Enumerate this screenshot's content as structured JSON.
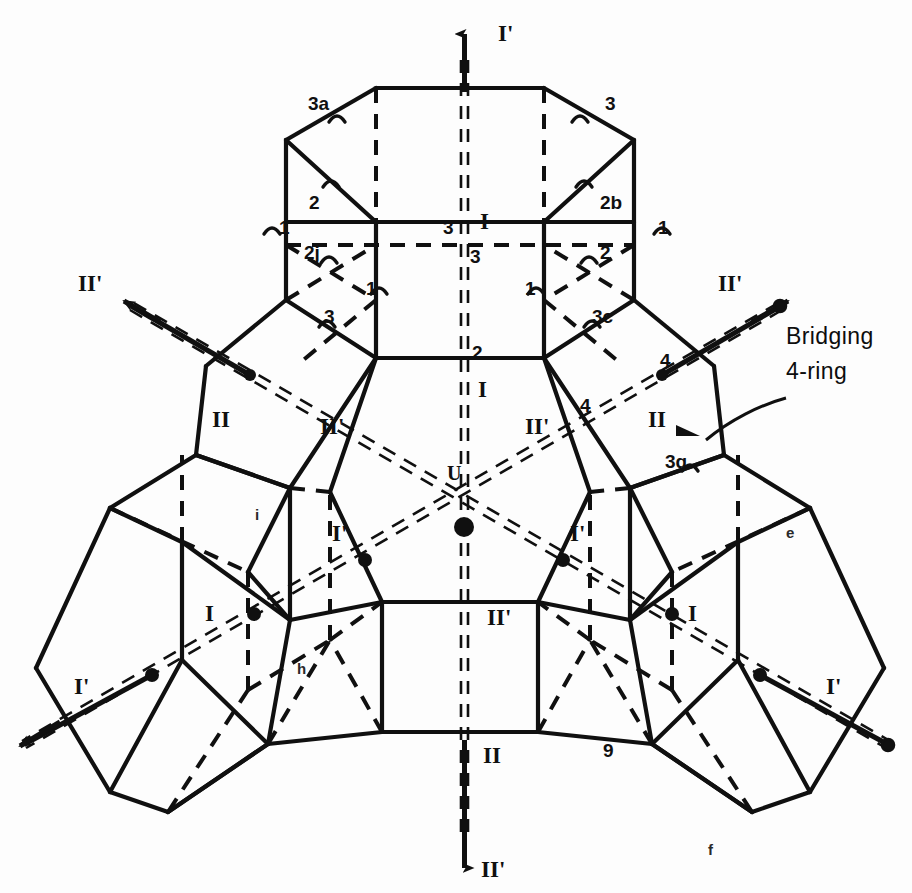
{
  "figure": {
    "type": "crystal-framework-schematic",
    "background_color": "#fdfdfd",
    "line_color": "#101010"
  },
  "annotations": {
    "bridging": {
      "line1": "Bridging",
      "line2": "4-ring"
    },
    "center_site": "U"
  },
  "axis_labels": [
    {
      "id": "axis-top-I-prime",
      "text": "I'",
      "x": 498,
      "y": 22
    },
    {
      "id": "axis-left-II-prime",
      "text": "II'",
      "x": 78,
      "y": 272
    },
    {
      "id": "axis-right-II-prime",
      "text": "II'",
      "x": 718,
      "y": 272
    },
    {
      "id": "axis-inner-left-II",
      "text": "II",
      "x": 212,
      "y": 408
    },
    {
      "id": "axis-inner-left-II-prime",
      "text": "II'",
      "x": 320,
      "y": 415
    },
    {
      "id": "axis-inner-right-II-prime",
      "text": "II'",
      "x": 525,
      "y": 415
    },
    {
      "id": "axis-inner-right-II",
      "text": "II",
      "x": 648,
      "y": 408
    },
    {
      "id": "axis-mid-left-I-prime",
      "text": "I'",
      "x": 332,
      "y": 522
    },
    {
      "id": "axis-mid-right-I-prime",
      "text": "I'",
      "x": 570,
      "y": 522
    },
    {
      "id": "axis-lower-left-I",
      "text": "I",
      "x": 205,
      "y": 602
    },
    {
      "id": "axis-lower-right-I",
      "text": "I",
      "x": 688,
      "y": 602
    },
    {
      "id": "axis-far-left-I-prime",
      "text": "I'",
      "x": 74,
      "y": 675
    },
    {
      "id": "axis-far-right-I-prime",
      "text": "I'",
      "x": 826,
      "y": 675
    },
    {
      "id": "axis-center-top-I",
      "text": "I",
      "x": 480,
      "y": 210
    },
    {
      "id": "axis-center-mid-I",
      "text": "I",
      "x": 478,
      "y": 378
    },
    {
      "id": "axis-center-II-prime-up",
      "text": "II'",
      "x": 487,
      "y": 606
    },
    {
      "id": "axis-center-II",
      "text": "II",
      "x": 483,
      "y": 744
    },
    {
      "id": "axis-bottom-II-prime",
      "text": "II'",
      "x": 481,
      "y": 858
    }
  ],
  "site_labels": [
    {
      "id": "site-3a",
      "text": "3a",
      "x": 308,
      "y": 94
    },
    {
      "id": "site-3-tr",
      "text": "3",
      "x": 605,
      "y": 94
    },
    {
      "id": "site-2-l",
      "text": "2",
      "x": 309,
      "y": 193
    },
    {
      "id": "site-2b",
      "text": "2b",
      "x": 600,
      "y": 193
    },
    {
      "id": "site-1-fl",
      "text": "1",
      "x": 279,
      "y": 218
    },
    {
      "id": "site-1-fr",
      "text": "1",
      "x": 658,
      "y": 218
    },
    {
      "id": "site-3-ctl",
      "text": "3",
      "x": 443,
      "y": 218
    },
    {
      "id": "site-3-ct",
      "text": "3",
      "x": 470,
      "y": 247
    },
    {
      "id": "site-2j",
      "text": "2j",
      "x": 304,
      "y": 243
    },
    {
      "id": "site-2-r",
      "text": "2",
      "x": 600,
      "y": 243
    },
    {
      "id": "site-1-il",
      "text": "1",
      "x": 366,
      "y": 279
    },
    {
      "id": "site-1-ir",
      "text": "1",
      "x": 525,
      "y": 279
    },
    {
      "id": "site-3-bl",
      "text": "3",
      "x": 324,
      "y": 307
    },
    {
      "id": "site-3c",
      "text": "3c",
      "x": 592,
      "y": 307
    },
    {
      "id": "site-2-cb",
      "text": "2",
      "x": 472,
      "y": 343
    },
    {
      "id": "site-4-ur",
      "text": "4",
      "x": 660,
      "y": 351
    },
    {
      "id": "site-4-mr",
      "text": "4",
      "x": 580,
      "y": 396
    },
    {
      "id": "site-3g",
      "text": "3g",
      "x": 665,
      "y": 452
    },
    {
      "id": "site-i",
      "text": "i",
      "x": 255,
      "y": 507
    },
    {
      "id": "site-e",
      "text": "e",
      "x": 786,
      "y": 525
    },
    {
      "id": "site-h",
      "text": "h",
      "x": 297,
      "y": 661
    },
    {
      "id": "site-9",
      "text": "9",
      "x": 603,
      "y": 741
    },
    {
      "id": "site-f",
      "text": "f",
      "x": 708,
      "y": 842
    }
  ],
  "tick_marks": [
    {
      "x": 337,
      "y": 116
    },
    {
      "x": 580,
      "y": 116
    },
    {
      "x": 331,
      "y": 181
    },
    {
      "x": 584,
      "y": 181
    },
    {
      "x": 272,
      "y": 228
    },
    {
      "x": 662,
      "y": 228
    },
    {
      "x": 329,
      "y": 257
    },
    {
      "x": 589,
      "y": 257
    },
    {
      "x": 379,
      "y": 288
    },
    {
      "x": 536,
      "y": 288
    },
    {
      "x": 327,
      "y": 321
    },
    {
      "x": 592,
      "y": 321
    },
    {
      "x": 690,
      "y": 465
    }
  ]
}
